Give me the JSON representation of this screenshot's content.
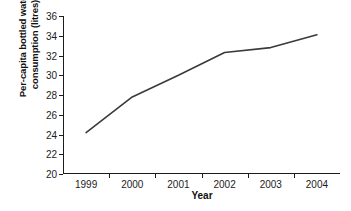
{
  "chart_data": {
    "type": "line",
    "title": "",
    "xlabel": "Year",
    "ylabel_line1": "Per-capita bottled water",
    "ylabel_line2": "consumption (litres)",
    "ylabel": "Per-capita bottled water consumption (litres)",
    "categories": [
      "1999",
      "2000",
      "2001",
      "2002",
      "2003",
      "2004"
    ],
    "x": [
      1999,
      2000,
      2001,
      2002,
      2003,
      2004
    ],
    "values": [
      24.2,
      27.8,
      30.0,
      32.3,
      32.8,
      34.1
    ],
    "series": [
      {
        "name": "Per-capita bottled water consumption",
        "values": [
          24.2,
          27.8,
          30.0,
          32.3,
          32.8,
          34.1
        ]
      }
    ],
    "ylim": [
      20,
      36
    ],
    "yticks": [
      20,
      22,
      24,
      26,
      28,
      30,
      32,
      34,
      36
    ],
    "ytick_labels": [
      "20",
      "22",
      "24",
      "26",
      "28",
      "30",
      "32",
      "34",
      "36"
    ],
    "xtick_labels": [
      "1999",
      "2000",
      "2001",
      "2002",
      "2003",
      "2004"
    ],
    "grid": false,
    "legend": false,
    "legend_position": "none",
    "line_color": "#3a3a3a",
    "axis_color": "#1c1c1c",
    "background_color": "#ffffff",
    "markers": false
  }
}
